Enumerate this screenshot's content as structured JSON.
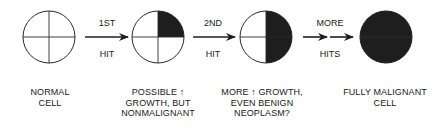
{
  "colors": {
    "stroke": "#2a2a2a",
    "fill": "#1e1e1e",
    "background": "#ffffff"
  },
  "stages": [
    {
      "id": "normal",
      "filled_quadrants": 0,
      "label_lines": [
        "NORMAL",
        "CELL"
      ]
    },
    {
      "id": "first-hit",
      "filled_quadrants": 1,
      "label_lines": [
        "POSSIBLE ↑",
        "GROWTH, BUT",
        "NONMALIGNANT"
      ]
    },
    {
      "id": "second-hit",
      "filled_quadrants": 2,
      "label_lines": [
        "MORE ↑ GROWTH,",
        "EVEN BENIGN",
        "NEOPLASM?"
      ]
    },
    {
      "id": "malignant",
      "filled_quadrants": 4,
      "label_lines": [
        "FULLY MALIGNANT",
        "CELL"
      ]
    }
  ],
  "transitions": [
    {
      "top": "1ST",
      "bottom": "HIT",
      "arrows": 1
    },
    {
      "top": "2ND",
      "bottom": "HIT",
      "arrows": 1
    },
    {
      "top": "MORE",
      "bottom": "HITS",
      "arrows": 2
    }
  ]
}
